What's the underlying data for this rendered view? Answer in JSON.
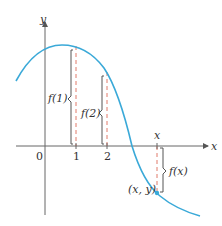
{
  "figure": {
    "type": "function-graph",
    "axes": {
      "x_label": "x",
      "y_label": "y",
      "origin_label": "0",
      "ticks": [
        {
          "value": "1",
          "px": 76
        },
        {
          "value": "2",
          "px": 107
        }
      ]
    },
    "curve": {
      "color": "#3aa9d8",
      "description": "decreasing bell-like curve peaking near x=1 then crossing x-axis between 2 and x"
    },
    "annotations": {
      "f1": "f(1)",
      "f2": "f(2)",
      "fx": "f(x)",
      "x_mark": "x",
      "point": "(x, y)"
    },
    "colors": {
      "axis": "#555555",
      "dashed": "#e07a6a",
      "bracket": "#555555",
      "point": "#3aa9d8"
    }
  }
}
